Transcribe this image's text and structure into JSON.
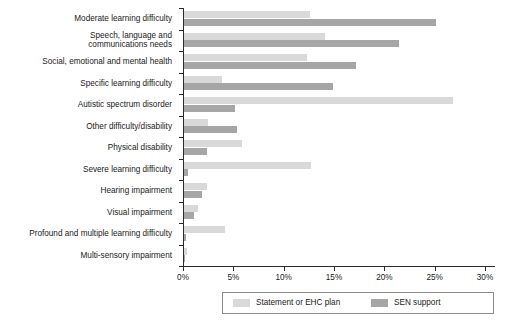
{
  "chart_data": {
    "type": "bar",
    "orientation": "horizontal",
    "title": "",
    "xlabel": "",
    "ylabel": "",
    "xlim": [
      0,
      30
    ],
    "xticks": [
      "0%",
      "5%",
      "10%",
      "15%",
      "20%",
      "25%",
      "30%"
    ],
    "xtick_values": [
      0,
      5,
      10,
      15,
      20,
      25,
      30
    ],
    "grid": false,
    "legend_position": "bottom",
    "categories": [
      "Moderate learning difficulty",
      "Speech, language and\ncommunications needs",
      "Social, emotional and mental health",
      "Specific learning difficulty",
      "Autistic spectrum disorder",
      "Other difficulty/disability",
      "Physical disability",
      "Severe learning difficulty",
      "Hearing impairment",
      "Visual impairment",
      "Profound and multiple learning difficulty",
      "Multi-sensory impairment"
    ],
    "series": [
      {
        "name": "Statement or EHC plan",
        "color": "#d9d9d9",
        "values": [
          12.5,
          14.0,
          12.2,
          3.8,
          26.7,
          2.4,
          5.8,
          12.6,
          2.3,
          1.4,
          4.1,
          0.3
        ]
      },
      {
        "name": "SEN support",
        "color": "#a6a6a6",
        "values": [
          25.0,
          21.4,
          17.1,
          14.8,
          5.1,
          5.3,
          2.3,
          0.4,
          1.8,
          1.0,
          0.2,
          0.1
        ]
      }
    ]
  },
  "legend": {
    "entries": [
      {
        "label": "Statement or EHC plan",
        "color": "#d9d9d9"
      },
      {
        "label": "SEN support",
        "color": "#a6a6a6"
      }
    ]
  },
  "colors": {
    "statement": "#d9d9d9",
    "sen": "#a6a6a6",
    "axis": "#2b2b2b",
    "text": "#1a1a1a",
    "background": "#ffffff"
  }
}
